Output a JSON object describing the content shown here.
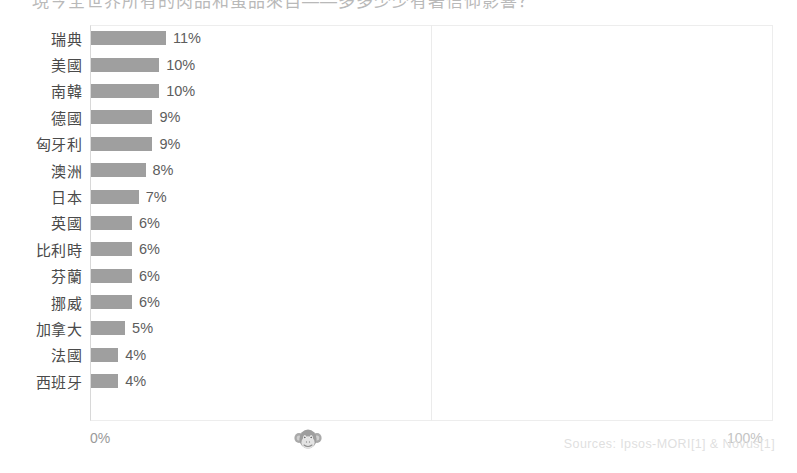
{
  "title": {
    "cropped_text": "現今全世界所有的肉品和蛋品來自——多多少少有著信仰影響？"
  },
  "chart_data": {
    "type": "bar",
    "orientation": "horizontal",
    "title": "",
    "xlabel": "",
    "ylabel": "",
    "xlim": [
      0,
      100
    ],
    "grid": true,
    "legend": null,
    "axis_ticks": [
      "0%",
      "100%"
    ],
    "categories": [
      "瑞典",
      "美國",
      "南韓",
      "德國",
      "匈牙利",
      "澳洲",
      "日本",
      "英國",
      "比利時",
      "芬蘭",
      "挪威",
      "加拿大",
      "法國",
      "西班牙"
    ],
    "values": [
      11,
      10,
      10,
      9,
      9,
      8,
      7,
      6,
      6,
      6,
      6,
      5,
      4,
      4
    ],
    "value_labels": [
      "11%",
      "10%",
      "10%",
      "9%",
      "9%",
      "8%",
      "7%",
      "6%",
      "6%",
      "6%",
      "6%",
      "5%",
      "4%",
      "4%"
    ],
    "bar_color": "#8a8a8a",
    "rows": [
      {
        "label": "瑞典",
        "value": 11,
        "value_label": "11%"
      },
      {
        "label": "美國",
        "value": 10,
        "value_label": "10%"
      },
      {
        "label": "南韓",
        "value": 10,
        "value_label": "10%"
      },
      {
        "label": "德國",
        "value": 9,
        "value_label": "9%"
      },
      {
        "label": "匈牙利",
        "value": 9,
        "value_label": "9%"
      },
      {
        "label": "澳洲",
        "value": 8,
        "value_label": "8%"
      },
      {
        "label": "日本",
        "value": 7,
        "value_label": "7%"
      },
      {
        "label": "英國",
        "value": 6,
        "value_label": "6%"
      },
      {
        "label": "比利時",
        "value": 6,
        "value_label": "6%"
      },
      {
        "label": "芬蘭",
        "value": 6,
        "value_label": "6%"
      },
      {
        "label": "挪威",
        "value": 6,
        "value_label": "6%"
      },
      {
        "label": "加拿大",
        "value": 5,
        "value_label": "5%"
      },
      {
        "label": "法國",
        "value": 4,
        "value_label": "4%"
      },
      {
        "label": "西班牙",
        "value": 4,
        "value_label": "4%"
      }
    ]
  },
  "axis": {
    "min_label": "0%",
    "max_label": "100%"
  },
  "watermark": {
    "icon": "monkey-face-icon"
  },
  "footer": {
    "sources": "Sources: Ipsos-MORI[1] & Novus[1]"
  }
}
